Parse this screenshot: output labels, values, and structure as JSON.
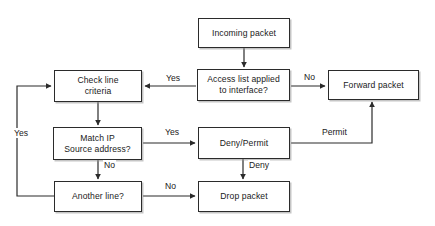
{
  "diagram": {
    "background_color": "#ffffff",
    "line_color": "#2b2b2b",
    "text_color": "#1a1a1a",
    "nodes": [
      {
        "id": "incoming_packet",
        "label": "Incoming packet",
        "x": 198,
        "y": 18,
        "w": 92,
        "h": 30
      },
      {
        "id": "access_list_applied",
        "label": "Access list applied\nto interface?",
        "x": 197,
        "y": 69,
        "w": 93,
        "h": 32
      },
      {
        "id": "forward_packet",
        "label": "Forward packet",
        "x": 328,
        "y": 70,
        "w": 91,
        "h": 30
      },
      {
        "id": "check_line_criteria",
        "label": "Check line\ncriteria",
        "x": 54,
        "y": 70,
        "w": 88,
        "h": 32
      },
      {
        "id": "match_ip_source",
        "label": "Match IP\nSource address?",
        "x": 53,
        "y": 127,
        "w": 89,
        "h": 33
      },
      {
        "id": "deny_permit",
        "label": "Deny/Permit",
        "x": 198,
        "y": 127,
        "w": 92,
        "h": 32
      },
      {
        "id": "another_line",
        "label": "Another line?",
        "x": 54,
        "y": 181,
        "w": 88,
        "h": 31
      },
      {
        "id": "drop_packet",
        "label": "Drop packet",
        "x": 198,
        "y": 181,
        "w": 92,
        "h": 31
      }
    ],
    "edge_labels": [
      {
        "id": "yes-access-to-check",
        "text": "Yes",
        "x": 165,
        "y": 73
      },
      {
        "id": "no-access-to-forward",
        "text": "No",
        "x": 303,
        "y": 72
      },
      {
        "id": "yes-loop-another-line",
        "text": "Yes",
        "x": 13,
        "y": 128
      },
      {
        "id": "yes-match-to-denypermit",
        "text": "Yes",
        "x": 164,
        "y": 127
      },
      {
        "id": "permit-to-forward",
        "text": "Permit",
        "x": 321,
        "y": 127
      },
      {
        "id": "no-match-to-another-line",
        "text": "No",
        "x": 103,
        "y": 160
      },
      {
        "id": "deny-to-drop",
        "text": "Deny",
        "x": 248,
        "y": 160
      },
      {
        "id": "no-another-line-to-drop",
        "text": "No",
        "x": 164,
        "y": 181
      }
    ]
  }
}
